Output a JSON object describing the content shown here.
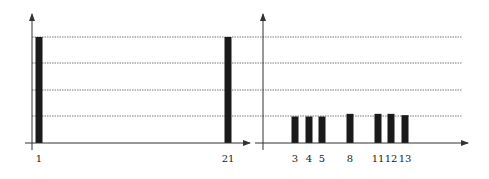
{
  "chart_data": [
    {
      "type": "bar",
      "title": "",
      "xlabel": "",
      "ylabel": "",
      "grid": true,
      "gridlines": 4,
      "categories": [
        "1",
        "21"
      ],
      "values": [
        4.0,
        4.0
      ],
      "ylim": [
        0,
        4.3
      ]
    },
    {
      "type": "bar",
      "title": "",
      "xlabel": "",
      "ylabel": "",
      "grid": true,
      "gridlines": 4,
      "categories": [
        "3",
        "4",
        "5",
        "8",
        "11",
        "12",
        "13"
      ],
      "values": [
        1.0,
        1.0,
        1.0,
        1.1,
        1.1,
        1.1,
        1.05
      ],
      "ylim": [
        0,
        4.3
      ]
    }
  ],
  "colors": {
    "bar": "#1a1a1a",
    "axis": "#333333",
    "grid": "#555555"
  }
}
